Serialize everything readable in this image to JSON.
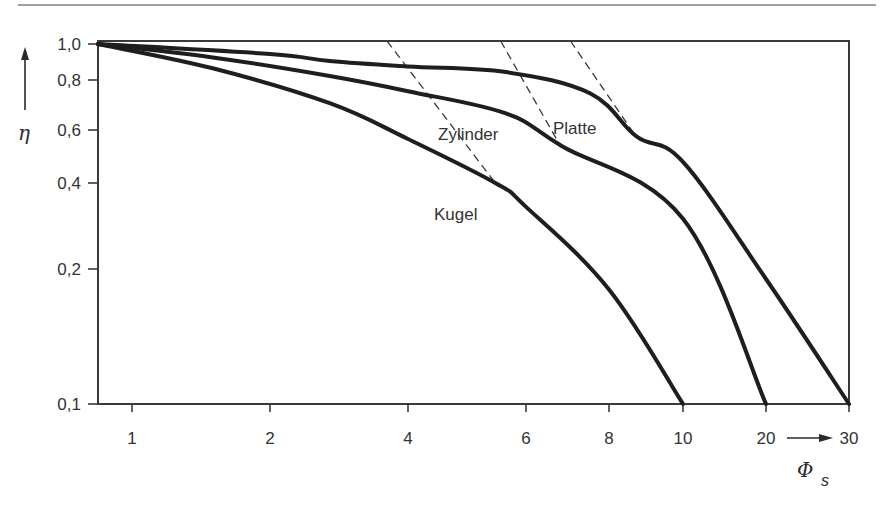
{
  "chart_data": {
    "type": "line",
    "title": "",
    "xlabel": "Φs",
    "xlabel_symbol": "Φ",
    "xlabel_subscript": "s",
    "ylabel": "η",
    "x_scale": "log (non-uniform)",
    "y_scale": "log (non-uniform)",
    "xlim": [
      0.8,
      30
    ],
    "ylim": [
      0.1,
      1.0
    ],
    "grid": false,
    "legend": "inline labels",
    "x_ticks": [
      {
        "value": 1,
        "label": "1",
        "px": 132
      },
      {
        "value": 2,
        "label": "2",
        "px": 270
      },
      {
        "value": 4,
        "label": "4",
        "px": 408
      },
      {
        "value": 6,
        "label": "6",
        "px": 526
      },
      {
        "value": 8,
        "label": "8",
        "px": 609
      },
      {
        "value": 10,
        "label": "10",
        "px": 683
      },
      {
        "value": 20,
        "label": "20",
        "px": 766
      },
      {
        "value": 30,
        "label": "30",
        "px": 849
      }
    ],
    "y_ticks": [
      {
        "value": 1.0,
        "label": "1,0",
        "px": 44
      },
      {
        "value": 0.8,
        "label": "0,8",
        "px": 80
      },
      {
        "value": 0.6,
        "label": "0,6",
        "px": 130
      },
      {
        "value": 0.4,
        "label": "0,4",
        "px": 183
      },
      {
        "value": 0.2,
        "label": "0,2",
        "px": 269
      },
      {
        "value": 0.1,
        "label": "0,1",
        "px": 404
      }
    ],
    "series": [
      {
        "name": "Kugel",
        "points": [
          [
            0.8,
            1.0
          ],
          [
            1.5,
            0.86
          ],
          [
            2.7,
            0.7
          ],
          [
            4.0,
            0.56
          ],
          [
            5.4,
            0.4
          ],
          [
            6.0,
            0.33
          ],
          [
            8.0,
            0.18
          ],
          [
            10.0,
            0.1
          ]
        ],
        "asymptote": [
          [
            3.6,
            1.0
          ],
          [
            5.4,
            0.4
          ]
        ]
      },
      {
        "name": "Zylinder",
        "points": [
          [
            0.8,
            1.0
          ],
          [
            1.5,
            0.92
          ],
          [
            2.7,
            0.82
          ],
          [
            4.0,
            0.75
          ],
          [
            5.6,
            0.66
          ],
          [
            6.8,
            0.53
          ],
          [
            10.0,
            0.3
          ],
          [
            20.0,
            0.1
          ]
        ],
        "asymptote": [
          [
            5.5,
            1.0
          ],
          [
            6.7,
            0.55
          ]
        ]
      },
      {
        "name": "Platte",
        "points": [
          [
            0.8,
            1.0
          ],
          [
            2.0,
            0.94
          ],
          [
            2.7,
            0.9
          ],
          [
            4.0,
            0.87
          ],
          [
            5.6,
            0.84
          ],
          [
            7.5,
            0.74
          ],
          [
            8.7,
            0.57
          ],
          [
            10.0,
            0.47
          ],
          [
            20.0,
            0.19
          ],
          [
            30.0,
            0.1
          ]
        ],
        "asymptote": [
          [
            7.0,
            1.0
          ],
          [
            8.6,
            0.59
          ]
        ]
      }
    ],
    "annotations": [
      {
        "text": "Kugel",
        "near": [
          5.0,
          0.32
        ]
      },
      {
        "text": "Zylinder",
        "near": [
          5.0,
          0.55
        ]
      },
      {
        "text": "Platte",
        "near": [
          7.2,
          0.58
        ]
      }
    ]
  },
  "labels": {
    "x_arrow": "→",
    "y_arrow": "↑"
  },
  "colors": {
    "curve": "#1e1e1e",
    "axis": "#3a3a3a",
    "dashed": "#3a3a3a",
    "rule": "#9a9a9a"
  }
}
